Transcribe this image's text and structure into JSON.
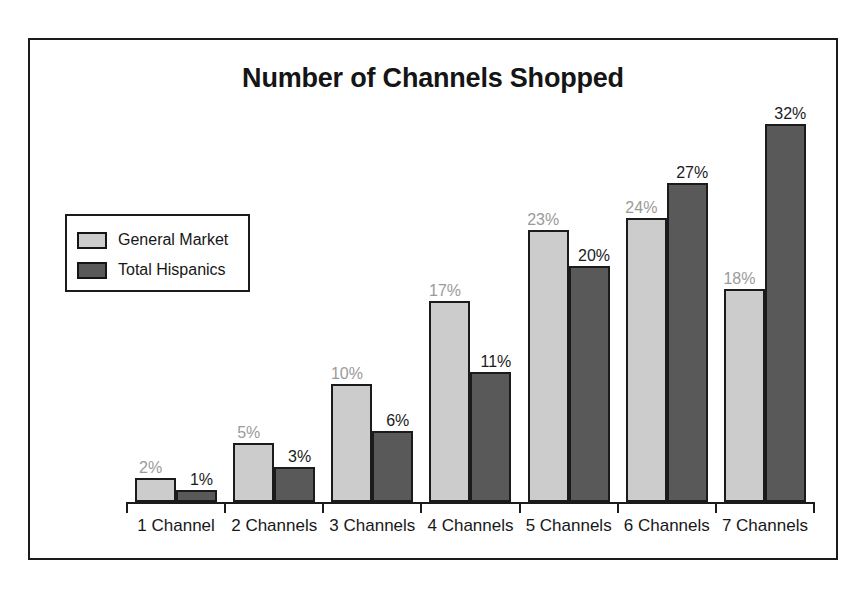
{
  "chart_data": {
    "type": "bar",
    "title": "Number of Channels Shopped",
    "xlabel": "",
    "ylabel": "",
    "ylim": [
      0,
      34
    ],
    "grid": false,
    "legend_position": "upper-left-inside",
    "value_suffix": "%",
    "categories": [
      "1 Channel",
      "2 Channels",
      "3 Channels",
      "4 Channels",
      "5 Channels",
      "6 Channels",
      "7 Channels"
    ],
    "series": [
      {
        "name": "General Market",
        "color": "#cccccc",
        "label_color": "#9a9a9a",
        "values": [
          2,
          5,
          10,
          17,
          23,
          24,
          18
        ],
        "labels": [
          "2%",
          "5%",
          "10%",
          "17%",
          "23%",
          "24%",
          "18%"
        ]
      },
      {
        "name": "Total Hispanics",
        "color": "#595959",
        "label_color": "#1b1b1b",
        "values": [
          1,
          3,
          6,
          11,
          20,
          27,
          32
        ],
        "labels": [
          "1%",
          "3%",
          "6%",
          "11%",
          "20%",
          "27%",
          "32%"
        ]
      }
    ]
  },
  "frame": {
    "border_color": "#1b1b1b"
  },
  "legend": {
    "items": [
      {
        "label": "General Market",
        "color": "#cccccc"
      },
      {
        "label": "Total Hispanics",
        "color": "#595959"
      }
    ]
  }
}
